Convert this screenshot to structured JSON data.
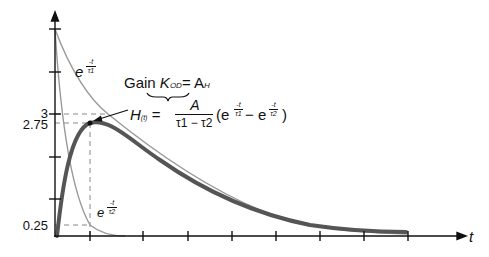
{
  "diagram": {
    "axes": {
      "x_label": "t",
      "y_ticks": [
        {
          "label": "3",
          "value": 3
        },
        {
          "label": "2.75",
          "value": 2.75
        },
        {
          "label": "0.25",
          "value": 0.25
        }
      ]
    },
    "curves": {
      "fast_decay_label_base": "e",
      "fast_decay_exp_num": "-t",
      "fast_decay_exp_den": "τ2",
      "slow_decay_label_base": "e",
      "slow_decay_exp_num": "-t",
      "slow_decay_exp_den": "τ1"
    },
    "annotations": {
      "gain_word": "Gain",
      "gain_symbol": "K",
      "gain_subscript": "OD",
      "gain_equals": "= A",
      "gain_rhs_subscript": "H",
      "h_symbol": "H",
      "h_subscript": "(t)",
      "h_equals": "=",
      "numerator": "A",
      "denominator": "τ1 − τ2",
      "paren_open": "(e",
      "minus": "− e",
      "paren_close": ")",
      "exp1_num": "-t",
      "exp1_den": "τ1",
      "exp2_num": "-t",
      "exp2_den": "τ2"
    },
    "colors": {
      "axis": "#111111",
      "main_curve": "#555555",
      "thin_curves": "#999999",
      "dashed": "#888888"
    }
  }
}
